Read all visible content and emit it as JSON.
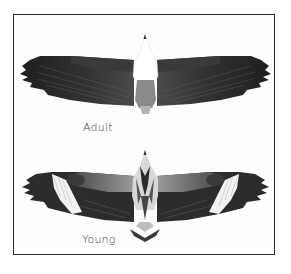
{
  "figure": {
    "panels": [
      {
        "id": "adult",
        "label": "Adult",
        "description": "dark wings, white head and breast, grey tail"
      },
      {
        "id": "young",
        "label": "Young",
        "description": "mottled brown-grey plumage, pale wing patches near wrists, wedge tail"
      }
    ]
  },
  "colors": {
    "border": "#2a2a2a",
    "background": "#ffffff",
    "wing_dark": "#2e2e2e",
    "wing_mid": "#555555",
    "body_white": "#ffffff",
    "label": "#3a3a3a"
  }
}
